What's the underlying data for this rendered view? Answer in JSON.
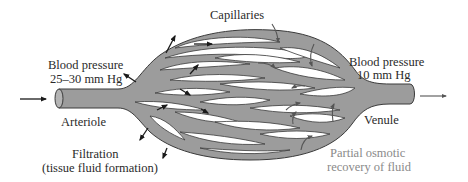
{
  "diagram": {
    "colors": {
      "vessel_fill": "#9c9c9c",
      "vessel_stroke": "#3a3a3a",
      "gap_fill": "#ffffff",
      "arrow": "#1a1a1a",
      "label_text": "#2a2a2a",
      "recovery_text": "#8a8a8a"
    },
    "labels": {
      "capillaries": "Capillaries",
      "bp_arterial_line1": "Blood pressure",
      "bp_arterial_line2": "25–30 mm Hg",
      "bp_venous_line1": "Blood pressure",
      "bp_venous_line2": "10 mm Hg",
      "arteriole": "Arteriole",
      "venule": "Venule",
      "filtration_line1": "Filtration",
      "filtration_line2": "(tissue fluid formation)",
      "recovery_line1": "Partial osmotic",
      "recovery_line2": "recovery of fluid"
    },
    "flow": {
      "inflow_arrow": "right-arrow",
      "outflow_arrow": "right-arrow"
    }
  }
}
